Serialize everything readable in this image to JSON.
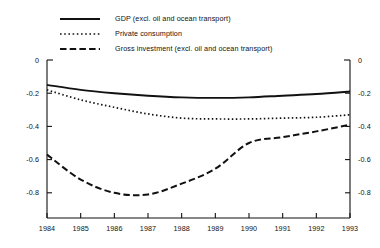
{
  "chart_data": {
    "type": "line",
    "title": "",
    "subtitle": "",
    "xlabel": "",
    "ylabel": "",
    "x": [
      1984,
      1985,
      1986,
      1987,
      1988,
      1989,
      1990,
      1991,
      1992,
      1993
    ],
    "xtick_labels": [
      "1984",
      "1985",
      "1986",
      "1987",
      "1988",
      "1989",
      "1990",
      "1991",
      "1992",
      "1993"
    ],
    "ytick_labels": [
      "0",
      "-0.2",
      "-0.4",
      "-0.6",
      "-0.8"
    ],
    "ytick_values": [
      0,
      -0.2,
      -0.4,
      -0.6,
      -0.8
    ],
    "xlim": [
      1984,
      1993
    ],
    "ylim": [
      -0.88,
      0
    ],
    "grid": false,
    "legend_position": "top-left",
    "axis_labels_both_sides": true,
    "series": [
      {
        "name": "GDP (excl. oil and ocean transport)",
        "style": "solid",
        "color": "#111111",
        "values": [
          -0.15,
          -0.18,
          -0.2,
          -0.215,
          -0.225,
          -0.228,
          -0.225,
          -0.215,
          -0.205,
          -0.19
        ]
      },
      {
        "name": "Private consumption",
        "style": "dotted",
        "color": "#111111",
        "values": [
          -0.18,
          -0.24,
          -0.285,
          -0.325,
          -0.35,
          -0.355,
          -0.355,
          -0.35,
          -0.345,
          -0.33
        ]
      },
      {
        "name": "Gross investment (excl. oil and ocean transport)",
        "style": "dashed",
        "color": "#111111",
        "values": [
          -0.57,
          -0.72,
          -0.8,
          -0.81,
          -0.745,
          -0.655,
          -0.5,
          -0.465,
          -0.43,
          -0.39
        ]
      }
    ]
  },
  "legend": {
    "items": [
      {
        "label": "GDP (excl. oil and ocean transport)",
        "style": "solid"
      },
      {
        "label": "Private consumption",
        "style": "dotted"
      },
      {
        "label": "Gross investment (excl. oil and ocean transport)",
        "style": "dashed"
      }
    ]
  },
  "axes": {
    "left_ticks": [
      "0",
      "-0.2",
      "-0.4",
      "-0.6",
      "-0.8"
    ],
    "right_ticks": [
      "0",
      "-0.2",
      "-0.4",
      "-0.6",
      "-0.8"
    ],
    "bottom_ticks": [
      "1984",
      "1985",
      "1986",
      "1987",
      "1988",
      "1989",
      "1990",
      "1991",
      "1992",
      "1993"
    ]
  },
  "colors": {
    "ink": "#111111",
    "background": "#ffffff"
  }
}
